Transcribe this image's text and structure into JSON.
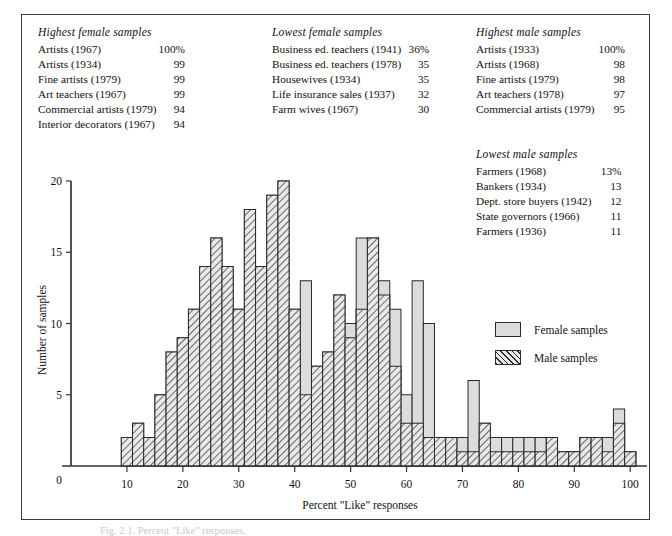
{
  "lists": [
    {
      "id": "highest-female",
      "title": "Highest female samples",
      "rows": [
        {
          "name": "Artists (1967)",
          "value": "100%"
        },
        {
          "name": "Artists (1934)",
          "value": "99"
        },
        {
          "name": "Fine artists (1979)",
          "value": "99"
        },
        {
          "name": "Art teachers (1967)",
          "value": "99"
        },
        {
          "name": "Commercial artists (1979)",
          "value": "94"
        },
        {
          "name": "Interior decorators (1967)",
          "value": "94"
        }
      ]
    },
    {
      "id": "lowest-female",
      "title": "Lowest female samples",
      "rows": [
        {
          "name": "Business ed. teachers (1941)",
          "value": "36%"
        },
        {
          "name": "Business ed. teachers (1978)",
          "value": "35"
        },
        {
          "name": "Housewives (1934)",
          "value": "35"
        },
        {
          "name": "Life insurance sales (1937)",
          "value": "32"
        },
        {
          "name": "Farm wives (1967)",
          "value": "30"
        }
      ]
    },
    {
      "id": "highest-male",
      "title": "Highest male samples",
      "rows": [
        {
          "name": "Artists (1933)",
          "value": "100%"
        },
        {
          "name": "Artists (1968)",
          "value": "98"
        },
        {
          "name": "Fine artists (1979)",
          "value": "98"
        },
        {
          "name": "Art teachers (1978)",
          "value": "97"
        },
        {
          "name": "Commercial artists (1979)",
          "value": "95"
        }
      ]
    },
    {
      "id": "lowest-male",
      "title": "Lowest male samples",
      "rows": [
        {
          "name": "Farmers (1968)",
          "value": "13%"
        },
        {
          "name": "Bankers (1934)",
          "value": "13"
        },
        {
          "name": "Dept. store buyers (1942)",
          "value": "12"
        },
        {
          "name": "State governors (1966)",
          "value": "11"
        },
        {
          "name": "Farmers (1936)",
          "value": "11"
        }
      ]
    }
  ],
  "legend": {
    "position": "inside-right",
    "items": [
      {
        "label": "Female samples",
        "swatch": "female",
        "color": "#dcdcdc"
      },
      {
        "label": "Male samples",
        "swatch": "male",
        "color": "#e9e9e9"
      }
    ]
  },
  "caption": "Fig. 2.1. Percent \"Like\" responses.",
  "chart_data": {
    "type": "bar",
    "title": "",
    "xlabel": "Percent \"Like\" responses",
    "ylabel": "Number of samples",
    "xlim": [
      0,
      103
    ],
    "ylim": [
      0,
      20
    ],
    "xticks": [
      0,
      10,
      20,
      30,
      40,
      50,
      60,
      70,
      80,
      90,
      100
    ],
    "yticks": [
      0,
      5,
      10,
      15,
      20
    ],
    "grid": false,
    "bin_width": 2,
    "note": "Overlapping (superimposed) histograms; female bars drawn solid light gray, male bars drawn with diagonal hatch. x = bin left edge in percent.",
    "bins": [
      9,
      11,
      13,
      15,
      17,
      19,
      21,
      23,
      25,
      27,
      29,
      31,
      33,
      35,
      37,
      39,
      41,
      43,
      45,
      47,
      49,
      51,
      53,
      55,
      57,
      59,
      61,
      63,
      65,
      67,
      69,
      71,
      73,
      75,
      77,
      79,
      81,
      83,
      85,
      87,
      89,
      91,
      93,
      95,
      97,
      99
    ],
    "series": [
      {
        "name": "Male samples",
        "fill": "hatch",
        "values": [
          2,
          3,
          2,
          5,
          8,
          9,
          11,
          14,
          16,
          14,
          11,
          18,
          14,
          19,
          20,
          11,
          5,
          7,
          8,
          12,
          9,
          11,
          16,
          12,
          7,
          3,
          3,
          2,
          2,
          2,
          1,
          1,
          3,
          1,
          1,
          1,
          1,
          1,
          2,
          1,
          1,
          2,
          2,
          1,
          3,
          1
        ]
      },
      {
        "name": "Female samples",
        "fill": "solid",
        "values": [
          0,
          0,
          0,
          0,
          0,
          0,
          0,
          0,
          0,
          0,
          1,
          1,
          2,
          2,
          2,
          2,
          13,
          4,
          7,
          8,
          10,
          16,
          11,
          13,
          11,
          5,
          13,
          10,
          2,
          2,
          2,
          6,
          2,
          2,
          2,
          2,
          2,
          2,
          2,
          1,
          1,
          2,
          2,
          2,
          4,
          1
        ]
      }
    ]
  }
}
